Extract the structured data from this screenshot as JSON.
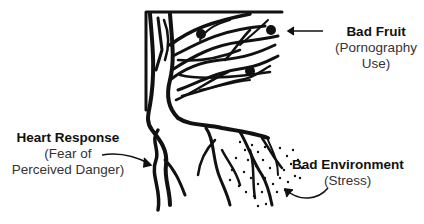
{
  "diagram": {
    "labels": {
      "bad_fruit": {
        "title": "Bad Fruit",
        "line1": "(Pornography",
        "line2": "Use)"
      },
      "heart_response": {
        "title": "Heart Response",
        "line1": "(Fear of",
        "line2": "Perceived Danger)"
      },
      "bad_environment": {
        "title": "Bad Environment",
        "line1": "(Stress)"
      }
    },
    "colors": {
      "ink": "#111111",
      "background": "#ffffff"
    }
  }
}
